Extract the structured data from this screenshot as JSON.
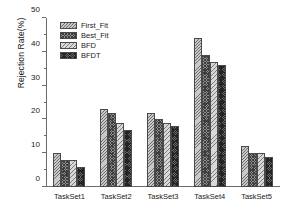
{
  "chart_data": {
    "type": "bar",
    "title": "",
    "xlabel": "",
    "ylabel": "Rejection Rate(%)",
    "ylim": [
      0,
      50
    ],
    "ytick_major_step": 10,
    "ytick_minor_step": 5,
    "yticks": [
      0,
      10,
      20,
      30,
      40,
      50
    ],
    "ytick_labels": [
      "0",
      "10",
      "20",
      "30",
      "40",
      "50"
    ],
    "grid": false,
    "legend_position": "top-left",
    "categories": [
      "TaskSet1",
      "TaskSet2",
      "TaskSet3",
      "TaskSet4",
      "TaskSet5"
    ],
    "series": [
      {
        "name": "First_Fit",
        "values": [
          10,
          23,
          22,
          44,
          12
        ]
      },
      {
        "name": "Best_Fit",
        "values": [
          8,
          22,
          20,
          39,
          10
        ]
      },
      {
        "name": "BFD",
        "values": [
          8,
          19,
          19,
          37,
          10
        ]
      },
      {
        "name": "BFDT",
        "values": [
          6,
          17,
          18,
          36,
          9
        ]
      }
    ]
  }
}
